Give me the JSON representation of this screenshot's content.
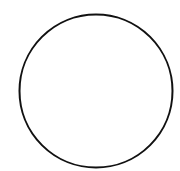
{
  "canvas": {
    "width": 180,
    "height": 171,
    "background": "#ffffff"
  },
  "shapes": [
    {
      "type": "circle",
      "cx": 96,
      "cy": 91,
      "r": 76.5,
      "stroke": "#111111",
      "stroke_width": 2,
      "fill": "none"
    }
  ]
}
